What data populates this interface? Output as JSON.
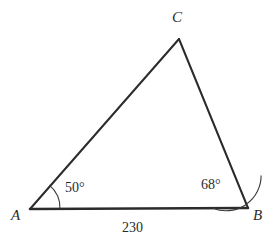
{
  "figure": {
    "type": "triangle-diagram",
    "background_color": "#ffffff",
    "stroke_color": "#2b2b2b",
    "arc_color": "#3a3a3a",
    "width": 274,
    "height": 250
  },
  "vertices": {
    "a": {
      "label": "A",
      "x": 30,
      "y": 209
    },
    "b": {
      "label": "B",
      "x": 248,
      "y": 208
    },
    "c": {
      "label": "C",
      "x": 179,
      "y": 39
    }
  },
  "angles": {
    "at_a": {
      "label": "50°",
      "value": 50,
      "arc_radius": 30
    },
    "at_b": {
      "label": "68°",
      "value": 68,
      "arc_radius": 35
    }
  },
  "sides": {
    "ab": {
      "label": "230",
      "value": 230
    }
  }
}
